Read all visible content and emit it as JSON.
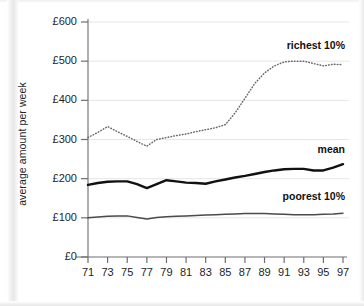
{
  "chart_data": {
    "type": "line",
    "title": "",
    "xlabel": "",
    "ylabel": "average amount per week",
    "x": [
      71,
      72,
      73,
      74,
      75,
      76,
      77,
      78,
      79,
      80,
      81,
      82,
      83,
      84,
      85,
      86,
      87,
      88,
      89,
      90,
      91,
      92,
      93,
      94,
      95,
      96,
      97
    ],
    "xtick_labels": [
      "71",
      "73",
      "75",
      "77",
      "79",
      "81",
      "83",
      "85",
      "87",
      "89",
      "91",
      "93",
      "95",
      "97"
    ],
    "xticks": [
      71,
      73,
      75,
      77,
      79,
      81,
      83,
      85,
      87,
      89,
      91,
      93,
      95,
      97
    ],
    "xlim": [
      71,
      97
    ],
    "ytick_labels": [
      "£0",
      "£100",
      "£200",
      "£300",
      "£400",
      "£500",
      "£600"
    ],
    "yticks": [
      0,
      100,
      200,
      300,
      400,
      500,
      600
    ],
    "ylim": [
      0,
      600
    ],
    "grid": true,
    "legend_position": "inline-right",
    "series": [
      {
        "name": "richest 10%",
        "style": "dotted",
        "color": "#555555",
        "label_x": 97,
        "label_y": 540,
        "values": [
          305,
          318,
          333,
          320,
          308,
          295,
          283,
          300,
          305,
          310,
          314,
          320,
          325,
          330,
          338,
          368,
          405,
          443,
          470,
          488,
          498,
          500,
          500,
          494,
          488,
          492,
          491
        ]
      },
      {
        "name": "mean",
        "style": "solid-thick",
        "color": "#111111",
        "label_x": 97,
        "label_y": 272,
        "values": [
          184,
          189,
          192,
          193,
          193,
          186,
          176,
          186,
          196,
          193,
          190,
          189,
          187,
          193,
          198,
          203,
          207,
          212,
          217,
          221,
          224,
          225,
          225,
          221,
          221,
          228,
          237
        ]
      },
      {
        "name": "poorest 10%",
        "style": "solid-thin",
        "color": "#4a4a4a",
        "label_x": 97,
        "label_y": 152,
        "values": [
          100,
          102,
          104,
          105,
          105,
          101,
          97,
          101,
          103,
          104,
          105,
          106,
          107,
          108,
          109,
          110,
          111,
          111,
          111,
          110,
          109,
          108,
          108,
          108,
          109,
          110,
          112
        ]
      }
    ]
  },
  "axis": {
    "y_title": "average amount per week"
  },
  "labels": {
    "richest": "richest 10%",
    "mean": "mean",
    "poorest": "poorest 10%"
  }
}
